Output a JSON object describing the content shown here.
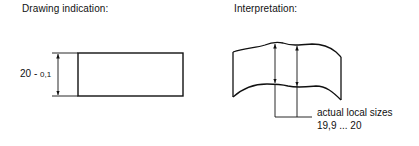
{
  "left_panel": {
    "title": "Drawing indication:",
    "dimension": {
      "nominal": "20",
      "separator": " - ",
      "tolerance": "0,1"
    }
  },
  "right_panel": {
    "title": "Interpretation:",
    "annotation_line1": "actual local sizes",
    "annotation_line2": "19,9 ... 20"
  }
}
